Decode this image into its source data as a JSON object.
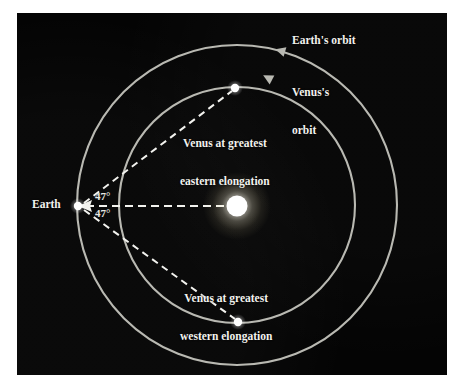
{
  "figure": {
    "background_color": "#040404",
    "page_color": "#ffffff",
    "orbit_color": "#b9b9b2",
    "line_color": "#f2f2ee"
  },
  "labels": {
    "earth_orbit": "Earth's orbit",
    "venus_orbit_line1": "Venus's",
    "venus_orbit_line2": "orbit",
    "earth": "Earth",
    "eastern_line1": "Venus at greatest",
    "eastern_line2": "eastern elongation",
    "western_line1": "Venus at greatest",
    "western_line2": "western elongation",
    "angle_upper": "47°",
    "angle_lower": "47°"
  },
  "diagram_data": {
    "type": "orbital-diagram",
    "sun": {
      "name": "Sun",
      "cx": 237,
      "cy": 206,
      "radius": 11,
      "color": "#ffffff",
      "glow": true
    },
    "orbits": [
      {
        "name": "Earth's orbit",
        "cx": 237,
        "cy": 205,
        "radius": 160,
        "direction": "counterclockwise",
        "arrow_angle_deg": 202
      },
      {
        "name": "Venus's orbit",
        "cx": 237,
        "cy": 205,
        "radius": 118,
        "direction": "counterclockwise",
        "arrow_angle_deg": 198
      }
    ],
    "bodies": [
      {
        "name": "Earth",
        "cx": 78,
        "cy": 206,
        "radius": 4.4,
        "on_orbit": "Earth's orbit"
      },
      {
        "name": "Venus at greatest eastern elongation",
        "cx": 235,
        "cy": 88,
        "radius": 4.4,
        "on_orbit": "Venus's orbit"
      },
      {
        "name": "Venus at greatest western elongation",
        "cx": 238,
        "cy": 322,
        "radius": 4.4,
        "on_orbit": "Venus's orbit"
      }
    ],
    "sight_lines": [
      {
        "name": "earth-to-eastern-venus",
        "from": [
          78,
          206
        ],
        "to": [
          235,
          88
        ],
        "style": "dashed"
      },
      {
        "name": "earth-to-western-venus",
        "from": [
          78,
          206
        ],
        "to": [
          238,
          322
        ],
        "style": "dashed"
      },
      {
        "name": "earth-to-sun",
        "from": [
          78,
          206
        ],
        "to": [
          237,
          206
        ],
        "style": "dashed"
      }
    ],
    "angles": [
      {
        "name": "eastern elongation angle",
        "value": 47,
        "unit": "degrees",
        "vertex": [
          78,
          206
        ]
      },
      {
        "name": "western elongation angle",
        "value": 47,
        "unit": "degrees",
        "vertex": [
          78,
          206
        ]
      }
    ]
  }
}
